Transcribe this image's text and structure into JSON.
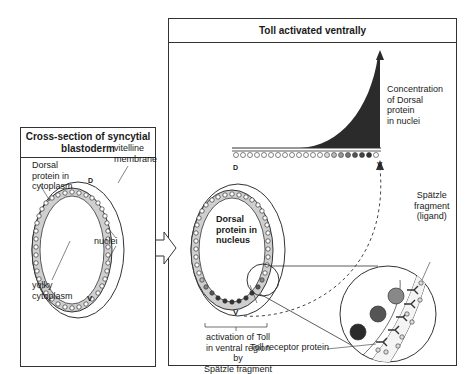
{
  "left_panel": {
    "title_line1": "Cross-section of syncytial",
    "title_line2": "blastoderm",
    "labels": {
      "dorsal_protein_cytoplasm": [
        "Dorsal",
        "protein in",
        "cytoplasm"
      ],
      "vitelline_membrane": [
        "vitelline",
        "membrane"
      ],
      "nuclei": "nuclei",
      "yolky_cytoplasm": [
        "yolky",
        "cytoplasm"
      ],
      "dorsal_marker": "D",
      "ventral_marker": "V"
    }
  },
  "right_panel": {
    "title": "Toll activated ventrally",
    "labels": {
      "concentration": [
        "Concentration",
        "of Dorsal",
        "protein",
        "in nuclei"
      ],
      "dorsal_marker": "D",
      "ventral_marker": "V",
      "dorsal_protein_nucleus": [
        "Dorsal",
        "protein in",
        "nucleus"
      ],
      "activation": [
        "activation of Toll",
        "in ventral region by",
        "Spätzle fragment"
      ],
      "spatzle": [
        "Spätzle",
        "fragment",
        "(ligand)"
      ],
      "toll_receptor": "Toll receptor protein",
      "gradient_axis_D": "D",
      "gradient_axis_V": "V"
    }
  },
  "colors": {
    "line": "#333333",
    "gradient_fill": "#2b2b2b",
    "membrane_grey": "#cfcfcf",
    "nucleus_dark": "#333333"
  }
}
